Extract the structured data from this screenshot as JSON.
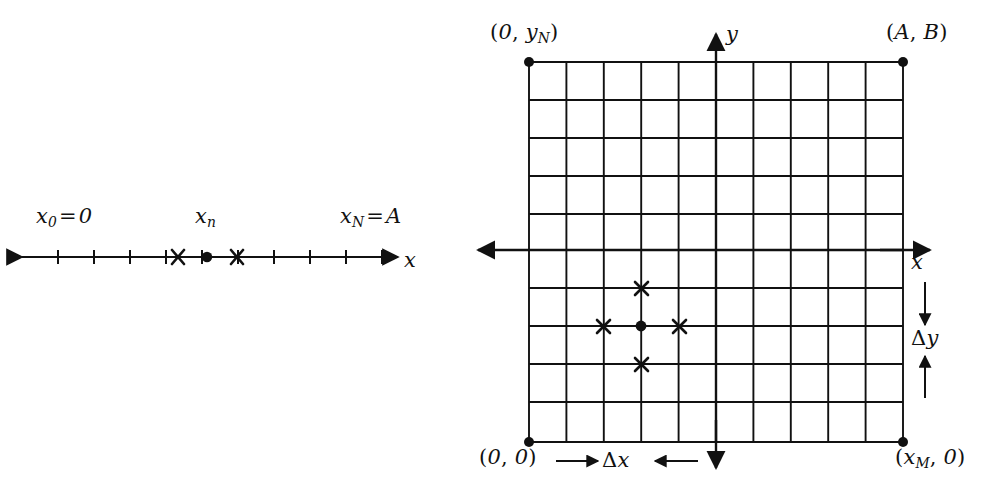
{
  "figure": {
    "width": 989,
    "height": 492,
    "background": "#ffffff",
    "ink": "#111111"
  },
  "left_panel": {
    "name": "one-dimensional-grid",
    "axis_label": "x",
    "labels": {
      "left_endpoint": "x0 = 0",
      "center_node": "xn",
      "right_endpoint": "xN = A"
    },
    "label_parts": {
      "left_endpoint": {
        "var": "x",
        "sub": "0",
        "op": "=",
        "value": "0"
      },
      "center_node": {
        "var": "x",
        "sub": "n"
      },
      "right_endpoint": {
        "var": "x",
        "sub": "N",
        "op": "=",
        "value": "A"
      }
    },
    "line": {
      "x_start": 18,
      "x_end": 400,
      "y": 257
    },
    "tick_count": 11,
    "tick_spacing": 36,
    "tick_half_height": 7,
    "markers": {
      "center_dot": {
        "x": 207,
        "y": 257,
        "type": "filled-circle"
      },
      "neighbor_left": {
        "x": 178,
        "y": 257,
        "type": "cross"
      },
      "neighbor_right": {
        "x": 237,
        "y": 257,
        "type": "cross"
      }
    }
  },
  "right_panel": {
    "name": "two-dimensional-grid",
    "grid": {
      "left": 529,
      "top": 62,
      "right": 903,
      "bottom": 442,
      "columns": 10,
      "rows": 10
    },
    "corner_labels": {
      "top_left": "(0, yN)",
      "top_right": "(A, B)",
      "bottom_left": "(0, 0)",
      "bottom_right": "(xM, 0)"
    },
    "corner_label_parts": {
      "top_left": {
        "first": "0",
        "second_var": "y",
        "second_sub": "N"
      },
      "top_right": {
        "first": "A",
        "second": "B"
      },
      "bottom_left": {
        "first": "0",
        "second": "0"
      },
      "bottom_right": {
        "first_var": "x",
        "first_sub": "M",
        "second": "0"
      }
    },
    "axes": {
      "x_label": "x",
      "y_label": "y",
      "x_axis_row_y": 250,
      "y_axis_col_x": 716
    },
    "spacing_labels": {
      "dx": "Δx",
      "dy": "Δy",
      "dx_parts": {
        "delta": "Δ",
        "var": "x"
      },
      "dy_parts": {
        "delta": "Δ",
        "var": "y"
      }
    },
    "stencil": {
      "center": {
        "x": 641,
        "y": 326,
        "type": "filled-circle"
      },
      "neighbors": [
        {
          "x": 641,
          "y": 288,
          "type": "cross",
          "position": "north"
        },
        {
          "x": 603,
          "y": 326,
          "type": "cross",
          "position": "west"
        },
        {
          "x": 679,
          "y": 326,
          "type": "cross",
          "position": "east"
        },
        {
          "x": 641,
          "y": 364,
          "type": "cross",
          "position": "south"
        }
      ]
    }
  }
}
